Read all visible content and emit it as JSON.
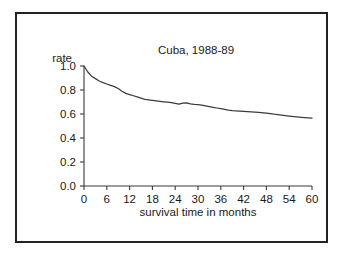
{
  "figure": {
    "border_color": "#222222",
    "background": "#ffffff",
    "line_color": "#3c3c3c"
  },
  "chart_data": {
    "type": "line",
    "title": "Cuba, 1988-89",
    "xlabel": "survival time in months",
    "ylabel": "rate",
    "xlim": [
      0,
      60
    ],
    "ylim": [
      0.0,
      1.0
    ],
    "grid": false,
    "legend": "none",
    "xticks": [
      0,
      6,
      12,
      18,
      24,
      30,
      36,
      42,
      48,
      54,
      60
    ],
    "xtick_labels": [
      "0",
      "6",
      "12",
      "18",
      "24",
      "30",
      "36",
      "42",
      "48",
      "54",
      "60"
    ],
    "yticks": [
      0.0,
      0.2,
      0.4,
      0.6,
      0.8,
      1.0
    ],
    "ytick_labels": [
      "0.0",
      "0.2",
      "0.4",
      "0.6",
      "0.8",
      "1.0"
    ],
    "series": [
      {
        "name": "survival rate",
        "x": [
          0,
          1,
          2,
          3,
          4,
          5,
          6,
          7,
          8,
          9,
          10,
          11,
          12,
          13,
          14,
          15,
          16,
          17,
          18,
          19,
          20,
          21,
          22,
          23,
          24,
          25,
          26,
          27,
          28,
          29,
          30,
          31,
          32,
          33,
          34,
          35,
          36,
          37,
          38,
          39,
          40,
          42,
          44,
          46,
          48,
          50,
          52,
          54,
          56,
          58,
          60
        ],
        "y": [
          1.0,
          0.95,
          0.915,
          0.895,
          0.875,
          0.862,
          0.85,
          0.838,
          0.828,
          0.812,
          0.79,
          0.772,
          0.762,
          0.752,
          0.742,
          0.732,
          0.722,
          0.718,
          0.714,
          0.71,
          0.706,
          0.702,
          0.698,
          0.694,
          0.688,
          0.682,
          0.69,
          0.692,
          0.684,
          0.68,
          0.678,
          0.674,
          0.668,
          0.662,
          0.656,
          0.65,
          0.644,
          0.638,
          0.632,
          0.628,
          0.626,
          0.622,
          0.618,
          0.614,
          0.608,
          0.598,
          0.59,
          0.583,
          0.576,
          0.57,
          0.565
        ]
      }
    ]
  }
}
